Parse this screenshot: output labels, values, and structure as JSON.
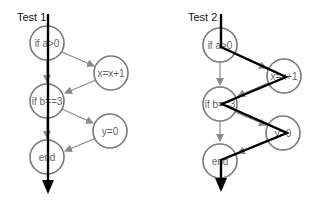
{
  "diagram": {
    "colors": {
      "node_stroke": "#7a7a7a",
      "edge": "#8a8a8a",
      "execution_path": "#000000",
      "text": "#666666"
    },
    "tests": [
      {
        "title": "Test 1",
        "nodes": [
          {
            "id": "a",
            "label": "if a>0"
          },
          {
            "id": "x",
            "label": "x=x+1"
          },
          {
            "id": "b",
            "label": "if b==3"
          },
          {
            "id": "y",
            "label": "y=0"
          },
          {
            "id": "end",
            "label": "end"
          }
        ],
        "edges": [
          [
            "a",
            "x"
          ],
          [
            "a",
            "b"
          ],
          [
            "x",
            "b"
          ],
          [
            "b",
            "y"
          ],
          [
            "b",
            "end"
          ],
          [
            "y",
            "end"
          ]
        ],
        "execution_path": [
          "a",
          "b",
          "end"
        ]
      },
      {
        "title": "Test 2",
        "nodes": [
          {
            "id": "a",
            "label": "if a>0"
          },
          {
            "id": "x",
            "label": "x=x+1"
          },
          {
            "id": "b",
            "label": "if b==3"
          },
          {
            "id": "y",
            "label": "y=0"
          },
          {
            "id": "end",
            "label": "end"
          }
        ],
        "edges": [
          [
            "a",
            "x"
          ],
          [
            "a",
            "b"
          ],
          [
            "x",
            "b"
          ],
          [
            "b",
            "y"
          ],
          [
            "b",
            "end"
          ],
          [
            "y",
            "end"
          ]
        ],
        "execution_path": [
          "a",
          "x",
          "b",
          "y",
          "end"
        ]
      }
    ]
  }
}
